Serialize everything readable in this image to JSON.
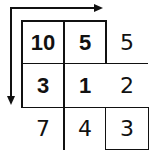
{
  "diagram": {
    "arrows": [
      {
        "name": "horizontal-arrow",
        "direction": "right"
      },
      {
        "name": "vertical-arrow",
        "direction": "down"
      }
    ],
    "grid": {
      "rows": [
        [
          {
            "value": "10",
            "bold": true
          },
          {
            "value": "5",
            "bold": true
          },
          {
            "value": "5",
            "bold": false
          }
        ],
        [
          {
            "value": "3",
            "bold": true
          },
          {
            "value": "1",
            "bold": true
          },
          {
            "value": "2",
            "bold": false
          }
        ],
        [
          {
            "value": "7",
            "bold": false
          },
          {
            "value": "4",
            "bold": false
          },
          {
            "value": "3",
            "bold": false
          }
        ]
      ]
    },
    "colors": {
      "line": "#111111",
      "background": "#ffffff"
    }
  }
}
